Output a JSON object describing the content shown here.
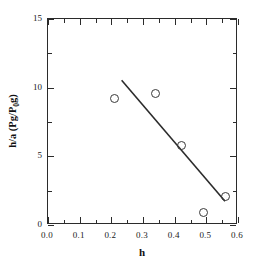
{
  "chart_data": {
    "type": "scatter",
    "title": "",
    "xlabel": "h",
    "ylabel": "h/a (Pg/P0g)",
    "ylabel_parts": {
      "pre": "h/a (Pg/P",
      "sub": "0",
      "post": "g)"
    },
    "xlim": [
      0.0,
      0.6
    ],
    "ylim": [
      0,
      15
    ],
    "grid": false,
    "legend": "none",
    "xticks": [
      0.0,
      0.1,
      0.2,
      0.3,
      0.4,
      0.5,
      0.6
    ],
    "xticklabels": [
      "0.0",
      "0.1",
      "0.2",
      "0.3",
      "0.4",
      "0.5",
      "0.6"
    ],
    "xminorticks": [
      0.05,
      0.15,
      0.25,
      0.35,
      0.45,
      0.55
    ],
    "yticks": [
      0,
      5,
      10,
      15
    ],
    "yticklabels": [
      "0",
      "5",
      "10",
      "15"
    ],
    "yminorticks": [
      2.5,
      7.5,
      12.5
    ],
    "marker_style": "open-circle",
    "points": [
      {
        "x": 0.21,
        "y": 9.2
      },
      {
        "x": 0.34,
        "y": 9.6
      },
      {
        "x": 0.42,
        "y": 5.8
      },
      {
        "x": 0.49,
        "y": 0.9
      },
      {
        "x": 0.56,
        "y": 2.1
      }
    ],
    "series": [
      {
        "name": "data",
        "x": [
          0.21,
          0.34,
          0.42,
          0.49,
          0.56
        ],
        "values": [
          9.2,
          9.6,
          5.8,
          0.9,
          2.1
        ]
      }
    ],
    "fit_line": {
      "name": "linear fit",
      "x": [
        0.235,
        0.565
      ],
      "y": [
        10.5,
        1.6
      ],
      "slope": -26.97,
      "intercept": 16.84,
      "color": "#2b2b2b"
    },
    "colors": {
      "axis": "#2b2b2b",
      "marker_edge": "#3a3a3a",
      "line": "#2b2b2b",
      "background": "#ffffff"
    }
  }
}
